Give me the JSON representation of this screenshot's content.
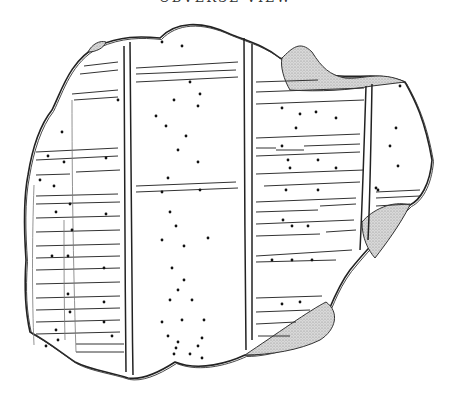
{
  "caption": {
    "text": "OBVERSE VIEW",
    "visible": "partially-clipped"
  },
  "figure": {
    "colors": {
      "ink": "#222222",
      "shade": "#bdbdbd",
      "background": "#ffffff"
    },
    "outline": "M98,46 C120,36 140,36 160,38 C175,22 200,20 230,34 C250,42 265,46 280,58 C300,66 320,75 340,76 C360,78 380,72 405,82 C415,100 425,120 432,160 C430,185 420,200 410,205 C395,220 370,245 350,270 C335,290 330,310 320,330 C300,345 270,355 245,355 C230,362 200,372 175,362 C155,375 140,380 128,378 C110,372 90,370 75,362 C55,348 45,340 30,332 C25,310 24,290 26,260 C24,230 23,200 28,175 C32,150 40,125 52,110 C62,90 70,60 98,46 Z",
    "shaded_regions": [
      {
        "name": "upper-right-chip",
        "path": "M282,58 C292,48 300,40 312,52 C322,68 330,75 345,78 C362,80 380,70 405,82 L372,86 C350,90 320,92 290,90 C284,80 280,66 282,58 Z"
      },
      {
        "name": "right-edge-chip",
        "path": "M362,222 C372,210 392,200 410,205 C400,225 385,245 375,258 C368,250 362,238 362,222 Z"
      },
      {
        "name": "lower-right-chip",
        "path": "M245,355 C275,335 310,310 326,302 C340,312 336,330 320,340 C300,350 270,355 245,355 Z"
      },
      {
        "name": "top-left-chip",
        "path": "M88,52 C92,44 100,40 106,42 C104,48 96,52 88,52 Z"
      }
    ],
    "columns": [
      {
        "name": "column-divider-1",
        "path": "M130,42 C131,120 131,250 133,375"
      },
      {
        "name": "column-divider-1b",
        "path": "M124,46 C124,140 125,260 126,372"
      },
      {
        "name": "column-divider-2",
        "path": "M244,38 C244,120 245,250 246,350"
      },
      {
        "name": "column-divider-2b",
        "path": "M252,44 C252,140 252,250 252,340"
      },
      {
        "name": "column-divider-3",
        "path": "M366,86 C364,150 362,210 360,250"
      },
      {
        "name": "column-divider-3b",
        "path": "M372,84 C371,140 370,200 368,240"
      },
      {
        "name": "subcolumn-left",
        "path": "M72,100 C72,170 73,260 76,352"
      },
      {
        "name": "subcolumn-left-inner",
        "path": "M64,220 C64,260 64,300 65,340"
      },
      {
        "name": "left-margin",
        "path": "M34,185 C32,240 32,300 34,345"
      }
    ],
    "rules": [
      "M84,66 L118,62",
      "M80,74 L118,70",
      "M72,94 L118,90",
      "M74,100 L118,97",
      "M36,152 L118,148",
      "M36,160 L118,156",
      "M36,175 L70,174",
      "M76,172 L120,170",
      "M36,196 L118,194",
      "M36,204 L120,202",
      "M36,218 L120,216",
      "M36,232 L120,230",
      "M36,246 L120,244",
      "M36,258 L120,256",
      "M36,270 L120,268",
      "M36,284 L120,282",
      "M36,298 L120,296",
      "M36,310 L120,308",
      "M36,322 L120,320",
      "M36,334 L120,332",
      "M76,344 L124,344",
      "M76,352 L124,352",
      "M136,68 L238,62",
      "M136,74 L236,70",
      "M136,82 L238,77",
      "M136,186 L236,182",
      "M136,192 L238,188",
      "M256,82 L318,80",
      "M256,92 L364,88",
      "M256,104 L364,100",
      "M256,138 L360,134",
      "M256,148 L276,148",
      "M276,150 L304,150",
      "M304,146 L360,144",
      "M256,156 L360,152",
      "M256,174 L364,170",
      "M264,186 L360,182",
      "M256,202 L356,198",
      "M256,212 L318,210",
      "M320,206 L356,204",
      "M256,224 L354,220",
      "M256,236 L320,234",
      "M326,232 L356,230",
      "M256,256 L352,250",
      "M256,262 L336,260",
      "M256,298 L322,296",
      "M256,312 L310,310",
      "M256,324 L296,322",
      "M258,336 L290,336",
      "M376,192 L420,190",
      "M376,198 L420,196",
      "M376,206 L410,204"
    ],
    "dots": [
      [
        162,
        42
      ],
      [
        182,
        46
      ],
      [
        190,
        82
      ],
      [
        200,
        94
      ],
      [
        156,
        116
      ],
      [
        174,
        100
      ],
      [
        198,
        106
      ],
      [
        166,
        126
      ],
      [
        186,
        136
      ],
      [
        178,
        150
      ],
      [
        198,
        162
      ],
      [
        168,
        178
      ],
      [
        162,
        192
      ],
      [
        200,
        190
      ],
      [
        170,
        212
      ],
      [
        176,
        226
      ],
      [
        162,
        240
      ],
      [
        208,
        238
      ],
      [
        184,
        246
      ],
      [
        172,
        268
      ],
      [
        184,
        280
      ],
      [
        178,
        290
      ],
      [
        170,
        300
      ],
      [
        192,
        300
      ],
      [
        162,
        322
      ],
      [
        182,
        320
      ],
      [
        204,
        320
      ],
      [
        168,
        336
      ],
      [
        178,
        342
      ],
      [
        202,
        338
      ],
      [
        176,
        348
      ],
      [
        198,
        346
      ],
      [
        174,
        354
      ],
      [
        190,
        354
      ],
      [
        202,
        358
      ],
      [
        62,
        132
      ],
      [
        48,
        156
      ],
      [
        64,
        162
      ],
      [
        118,
        100
      ],
      [
        106,
        158
      ],
      [
        40,
        180
      ],
      [
        54,
        186
      ],
      [
        106,
        214
      ],
      [
        70,
        204
      ],
      [
        56,
        212
      ],
      [
        72,
        230
      ],
      [
        52,
        256
      ],
      [
        68,
        256
      ],
      [
        104,
        268
      ],
      [
        68,
        294
      ],
      [
        70,
        312
      ],
      [
        104,
        302
      ],
      [
        56,
        330
      ],
      [
        104,
        322
      ],
      [
        112,
        336
      ],
      [
        46,
        346
      ],
      [
        58,
        340
      ],
      [
        282,
        108
      ],
      [
        300,
        114
      ],
      [
        316,
        112
      ],
      [
        336,
        118
      ],
      [
        296,
        128
      ],
      [
        282,
        146
      ],
      [
        288,
        160
      ],
      [
        318,
        160
      ],
      [
        290,
        168
      ],
      [
        336,
        168
      ],
      [
        286,
        190
      ],
      [
        318,
        190
      ],
      [
        283,
        220
      ],
      [
        292,
        226
      ],
      [
        308,
        226
      ],
      [
        272,
        260
      ],
      [
        292,
        260
      ],
      [
        312,
        260
      ],
      [
        282,
        304
      ],
      [
        300,
        302
      ],
      [
        376,
        188
      ],
      [
        400,
        86
      ],
      [
        396,
        128
      ],
      [
        390,
        146
      ],
      [
        398,
        166
      ],
      [
        378,
        190
      ]
    ]
  }
}
